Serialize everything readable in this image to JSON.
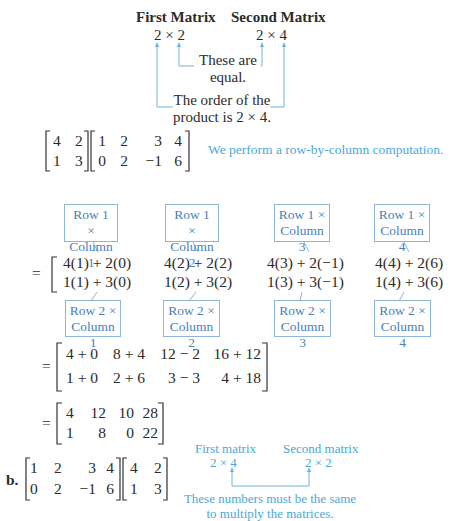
{
  "part_a": {
    "header": {
      "first_label": "First Matrix",
      "second_label": "Second Matrix",
      "first_dims": "2 × 2",
      "second_dims": "2 × 4",
      "equal_note_line1": "These are",
      "equal_note_line2": "equal.",
      "order_note_line1": "The order of the",
      "order_note_line2": "product is 2 × 4."
    },
    "problem": {
      "matrix_a": [
        [
          "4",
          "2"
        ],
        [
          "1",
          "3"
        ]
      ],
      "matrix_b": [
        [
          "1",
          "2",
          "3",
          "4"
        ],
        [
          "0",
          "2",
          "−1",
          "6"
        ]
      ],
      "note": "We perform a row-by-column computation."
    },
    "row1_boxes": [
      {
        "line1": "Row 1 ×",
        "line2": "Column 1"
      },
      {
        "line1": "Row 1 ×",
        "line2": "Column 2"
      },
      {
        "line1": "Row 1 ×",
        "line2": "Column 3"
      },
      {
        "line1": "Row 1 ×",
        "line2": "Column 4"
      }
    ],
    "expansion": {
      "equals": "=",
      "rows": [
        [
          "4(1) + 2(0)",
          "4(2) + 2(2)",
          "4(3) + 2(−1)",
          "4(4) + 2(6)"
        ],
        [
          "1(1) + 3(0)",
          "1(2) + 3(2)",
          "1(3) + 3(−1)",
          "1(4) + 3(6)"
        ]
      ]
    },
    "row2_boxes": [
      {
        "line1": "Row 2 ×",
        "line2": "Column 1"
      },
      {
        "line1": "Row 2 ×",
        "line2": "Column 2"
      },
      {
        "line1": "Row 2 ×",
        "line2": "Column 3"
      },
      {
        "line1": "Row 2 ×",
        "line2": "Column 4"
      }
    ],
    "sums": {
      "equals": "=",
      "rows": [
        [
          "4 + 0",
          "8 + 4",
          "12 − 2",
          "16 + 12"
        ],
        [
          "1 + 0",
          "2 + 6",
          "3 − 3",
          "4 + 18"
        ]
      ]
    },
    "result": {
      "equals": "=",
      "rows": [
        [
          "4",
          "12",
          "10",
          "28"
        ],
        [
          "1",
          "8",
          "0",
          "22"
        ]
      ]
    }
  },
  "part_b": {
    "label": "b.",
    "matrix_a": [
      [
        "1",
        "2",
        "3",
        "4"
      ],
      [
        "0",
        "2",
        "−1",
        "6"
      ]
    ],
    "matrix_b": [
      [
        "4",
        "2"
      ],
      [
        "1",
        "3"
      ]
    ],
    "first_label": "First matrix",
    "second_label": "Second matrix",
    "first_dims": "2 × 4",
    "second_dims": "2 × 2",
    "note_line1": "These numbers must be the same",
    "note_line2": "to multiply the matrices."
  },
  "colors": {
    "text": "#2b2b2b",
    "annotation_blue": "#4aa8d8",
    "box_border": "#8fb5d8",
    "box_text": "#4a7fb8"
  }
}
